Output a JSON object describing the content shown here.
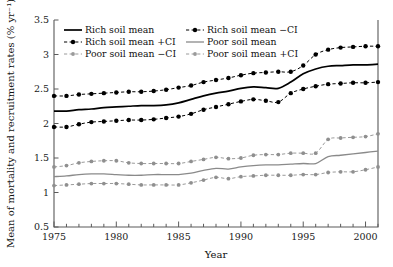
{
  "chart_data": {
    "type": "line",
    "title": "",
    "xlabel": "Year",
    "ylabel": "Mean of mortality and recruitment rates (% yr⁻¹)",
    "xlim": [
      1975,
      2001
    ],
    "ylim": [
      0.5,
      3.5
    ],
    "xticks": [
      1975,
      1980,
      1985,
      1990,
      1995,
      2000
    ],
    "xticklabels": [
      "1975",
      "1980",
      "1985",
      "1990",
      "1995",
      "2000"
    ],
    "xminor_step": 1,
    "yticks": [
      0.5,
      1,
      1.5,
      2,
      2.5,
      3,
      3.5
    ],
    "yticklabels": [
      "0.5",
      "1",
      "1.5",
      "2",
      "2.5",
      "3",
      "3.5"
    ],
    "grid": false,
    "legend_position": "upper-left-inside",
    "x": [
      1975,
      1976,
      1977,
      1978,
      1979,
      1980,
      1981,
      1982,
      1983,
      1984,
      1985,
      1986,
      1987,
      1988,
      1989,
      1990,
      1991,
      1992,
      1993,
      1994,
      1995,
      1996,
      1997,
      1998,
      1999,
      2000,
      2001
    ],
    "series": [
      {
        "name": "Rich soil mean",
        "style": "solid",
        "color": "#000000",
        "markers": false,
        "values": [
          2.18,
          2.18,
          2.2,
          2.21,
          2.23,
          2.24,
          2.25,
          2.26,
          2.26,
          2.27,
          2.3,
          2.35,
          2.4,
          2.44,
          2.47,
          2.51,
          2.53,
          2.52,
          2.51,
          2.6,
          2.72,
          2.79,
          2.83,
          2.84,
          2.85,
          2.85,
          2.86
        ]
      },
      {
        "name": "Rich soil mean −CI",
        "style": "dashed",
        "color": "#000000",
        "markers": true,
        "values": [
          1.95,
          1.95,
          1.99,
          2.02,
          2.03,
          2.04,
          2.05,
          2.05,
          2.06,
          2.08,
          2.1,
          2.14,
          2.2,
          2.24,
          2.28,
          2.32,
          2.35,
          2.33,
          2.31,
          2.44,
          2.5,
          2.54,
          2.57,
          2.58,
          2.59,
          2.59,
          2.6
        ]
      },
      {
        "name": "Rich soil mean +CI",
        "style": "dashed",
        "color": "#000000",
        "markers": true,
        "values": [
          2.4,
          2.4,
          2.42,
          2.43,
          2.44,
          2.45,
          2.46,
          2.46,
          2.47,
          2.49,
          2.52,
          2.55,
          2.6,
          2.63,
          2.66,
          2.7,
          2.73,
          2.74,
          2.75,
          2.75,
          2.84,
          3.0,
          3.07,
          3.1,
          3.11,
          3.12,
          3.12
        ]
      },
      {
        "name": "Poor soil mean",
        "style": "solid",
        "color": "#8a8a8a",
        "markers": false,
        "values": [
          1.23,
          1.24,
          1.26,
          1.27,
          1.27,
          1.26,
          1.25,
          1.25,
          1.26,
          1.26,
          1.26,
          1.28,
          1.32,
          1.35,
          1.34,
          1.37,
          1.39,
          1.4,
          1.4,
          1.41,
          1.42,
          1.42,
          1.52,
          1.54,
          1.56,
          1.58,
          1.6
        ]
      },
      {
        "name": "Poor soil mean −CI",
        "style": "dashed",
        "color": "#9a9a9a",
        "markers": true,
        "values": [
          1.1,
          1.11,
          1.12,
          1.13,
          1.13,
          1.13,
          1.12,
          1.11,
          1.11,
          1.11,
          1.11,
          1.14,
          1.18,
          1.22,
          1.2,
          1.23,
          1.24,
          1.25,
          1.25,
          1.25,
          1.26,
          1.26,
          1.29,
          1.3,
          1.3,
          1.33,
          1.37
        ]
      },
      {
        "name": "Poor soil mean +CI",
        "style": "dashed",
        "color": "#9a9a9a",
        "markers": true,
        "values": [
          1.37,
          1.39,
          1.43,
          1.45,
          1.46,
          1.46,
          1.43,
          1.42,
          1.42,
          1.42,
          1.42,
          1.45,
          1.48,
          1.51,
          1.49,
          1.5,
          1.54,
          1.55,
          1.55,
          1.57,
          1.57,
          1.57,
          1.77,
          1.79,
          1.8,
          1.81,
          1.85
        ]
      }
    ],
    "legend": [
      {
        "label": "Rich soil mean",
        "style": "solid",
        "color": "#000000",
        "marker": false
      },
      {
        "label": "Rich soil mean −CI",
        "style": "dashed",
        "color": "#000000",
        "marker": true
      },
      {
        "label": "Rich soil mean +CI",
        "style": "dashed",
        "color": "#000000",
        "marker": true
      },
      {
        "label": "Poor soil mean",
        "style": "solid",
        "color": "#8a8a8a",
        "marker": false
      },
      {
        "label": "Poor soil mean −CI",
        "style": "dashed",
        "color": "#9a9a9a",
        "marker": true
      },
      {
        "label": "Poor soil mean +CI",
        "style": "dashed",
        "color": "#9a9a9a",
        "marker": true
      }
    ]
  }
}
